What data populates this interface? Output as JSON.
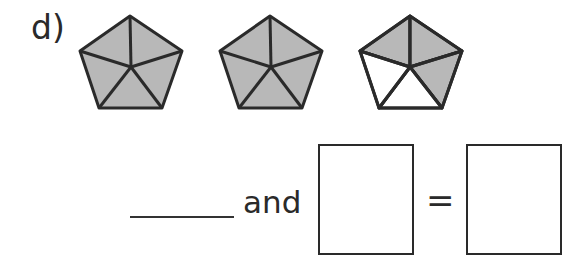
{
  "question": {
    "label": "d)",
    "pentagons": [
      {
        "parts": 5,
        "shaded": 5
      },
      {
        "parts": 5,
        "shaded": 5
      },
      {
        "parts": 5,
        "shaded": 3
      }
    ],
    "equation": {
      "blank_line": "",
      "connector": "and",
      "box1_value": "",
      "equals": "=",
      "box2_value": ""
    }
  },
  "colors": {
    "shade": "#b8b8b8",
    "outline": "#2a2a2a",
    "unshaded": "#ffffff"
  }
}
